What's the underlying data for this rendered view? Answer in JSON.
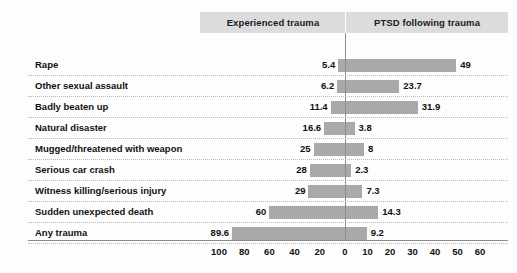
{
  "chart_data": {
    "type": "bar",
    "subtype": "diverging-horizontal-bar",
    "title": "",
    "xlabel": "",
    "ylabel": "",
    "grid": "horizontal-dotted",
    "legend_position": "top-band",
    "panels": [
      {
        "name": "left",
        "label": "Experienced trauma",
        "direction": "left",
        "axis_ticks": [
          100,
          80,
          60,
          40,
          20,
          0
        ],
        "axis_tick_labels": [
          "100",
          "80",
          "60",
          "40",
          "20",
          "0"
        ],
        "xlim": [
          0,
          100
        ]
      },
      {
        "name": "right",
        "label": "PTSD following trauma",
        "direction": "right",
        "axis_ticks": [
          0,
          10,
          20,
          30,
          40,
          50,
          60
        ],
        "axis_tick_labels": [
          "0",
          "10",
          "20",
          "30",
          "40",
          "50",
          "60"
        ],
        "xlim": [
          0,
          60
        ]
      }
    ],
    "categories": [
      "Rape",
      "Other sexual assault",
      "Badly beaten up",
      "Natural disaster",
      "Mugged/threatened with weapon",
      "Serious car crash",
      "Witness killing/serious injury",
      "Sudden unexpected death",
      "Any trauma"
    ],
    "series": [
      {
        "name": "Experienced trauma",
        "values": [
          5.4,
          6.2,
          11.4,
          16.6,
          25,
          28,
          29,
          60,
          89.6
        ],
        "labels": [
          "5.4",
          "6.2",
          "11.4",
          "16.6",
          "25",
          "28",
          "29",
          "60",
          "89.6"
        ],
        "color": "#a9a9a9"
      },
      {
        "name": "PTSD following trauma",
        "values": [
          49,
          23.7,
          31.9,
          3.8,
          8,
          2.3,
          7.3,
          14.3,
          9.2
        ],
        "labels": [
          "49",
          "23.7",
          "31.9",
          "3.8",
          "8",
          "2.3",
          "7.3",
          "14.3",
          "9.2"
        ],
        "color": "#a9a9a9"
      }
    ],
    "colors": {
      "bar": "#a9a9a9",
      "header_band": "#dcdcdc",
      "axis": "#8c8c8c",
      "grid": "#b9b9b9",
      "text": "#111111",
      "background": "#fdfdfd"
    }
  }
}
